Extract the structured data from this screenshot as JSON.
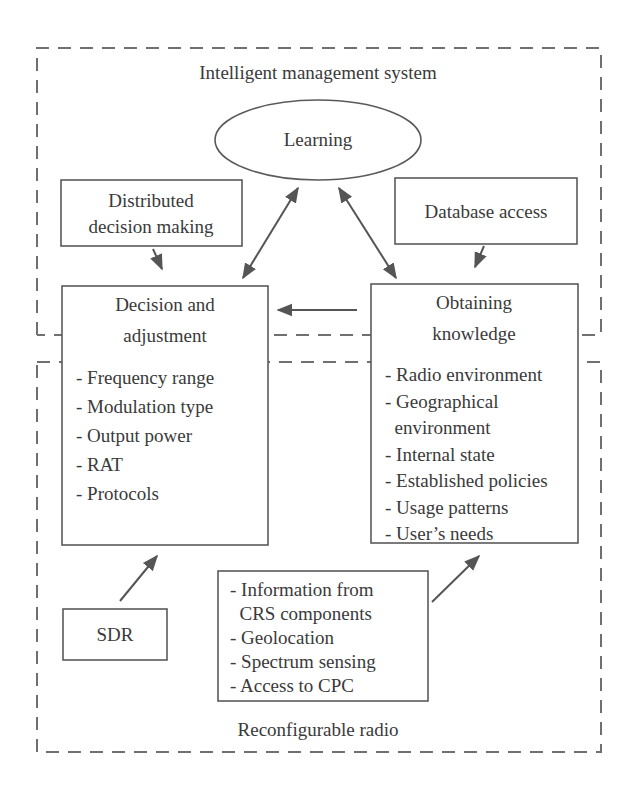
{
  "diagram": {
    "regions": {
      "upper_label": "Intelligent management system",
      "lower_label": "Reconfigurable radio"
    },
    "learning": {
      "label": "Learning"
    },
    "distributed": {
      "lines": [
        "Distributed",
        "decision making"
      ]
    },
    "database": {
      "label": "Database access"
    },
    "decision": {
      "title": [
        "Decision and",
        "adjustment"
      ],
      "items": [
        "- Frequency range",
        "- Modulation type",
        "- Output power",
        "- RAT",
        "- Protocols"
      ]
    },
    "knowledge": {
      "title": [
        "Obtaining",
        "knowledge"
      ],
      "items": [
        "- Radio environment",
        "- Geographical",
        "  environment",
        "- Internal state",
        "- Established policies",
        "- Usage patterns",
        "- User’s needs"
      ]
    },
    "sdr": {
      "label": "SDR"
    },
    "sources": {
      "items": [
        "- Information from",
        "  CRS components",
        "- Geolocation",
        "- Spectrum sensing",
        "- Access to CPC"
      ]
    },
    "connections": [
      {
        "from": "learning",
        "to": "decision",
        "type": "bidirectional"
      },
      {
        "from": "learning",
        "to": "knowledge",
        "type": "bidirectional"
      },
      {
        "from": "distributed",
        "to": "decision",
        "type": "directed"
      },
      {
        "from": "database",
        "to": "knowledge",
        "type": "directed"
      },
      {
        "from": "knowledge",
        "to": "decision",
        "type": "directed"
      },
      {
        "from": "sdr",
        "to": "decision",
        "type": "directed"
      },
      {
        "from": "sources",
        "to": "knowledge",
        "type": "directed"
      }
    ],
    "colors": {
      "text": "#3a3a3a",
      "line": "#5a5a5a",
      "dash": "#707070",
      "background": "#ffffff"
    }
  }
}
